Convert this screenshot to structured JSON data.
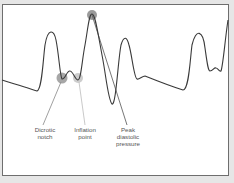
{
  "diagram": {
    "colors": {
      "waveform": "#3a3a3a",
      "leader_dark": "#777777",
      "leader_light": "#bbbbbb",
      "marker_dark": "#8a8a8a",
      "marker_light": "#c4c4c4",
      "label_text": "#555555",
      "frame_border": "#6e6e6e",
      "background": "#e6e6e6"
    },
    "labels": [
      {
        "id": "dicrotic-notch",
        "line1": "Dicrotic",
        "line2": "notch",
        "line3": ""
      },
      {
        "id": "inflation-point",
        "line1": "Inflation",
        "line2": "point",
        "line3": ""
      },
      {
        "id": "peak-diastolic-pressure",
        "line1": "Peak",
        "line2": "diastolic",
        "line3": "pressure"
      }
    ]
  }
}
